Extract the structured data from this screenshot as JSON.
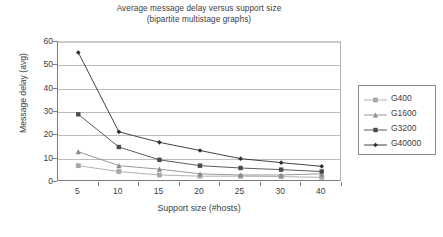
{
  "chart_data": {
    "type": "line",
    "title": "Average message delay versus support size",
    "subtitle": "(bipartite multistage graphs)",
    "xlabel": "Support size (#hosts)",
    "ylabel": "Message delay (avg)",
    "categories": [
      "5",
      "10",
      "15",
      "20",
      "25",
      "30",
      "40"
    ],
    "ylim": [
      0,
      60
    ],
    "yticks": [
      "0",
      "10",
      "20",
      "30",
      "40",
      "50",
      "60"
    ],
    "grid": "horizontal",
    "legend_position": "right",
    "series": [
      {
        "name": "G400",
        "marker": "square",
        "color": "#a8a8a8",
        "values": [
          7,
          4.5,
          3,
          2.5,
          2.5,
          2.3,
          2
        ]
      },
      {
        "name": "G1600",
        "marker": "triangle",
        "color": "#8c8c8c",
        "values": [
          13,
          7,
          5.5,
          3.5,
          3,
          3,
          3.5
        ]
      },
      {
        "name": "G3200",
        "marker": "square-dark",
        "color": "#4a4a4a",
        "values": [
          29,
          15,
          9.5,
          7,
          6,
          5.3,
          4.5
        ]
      },
      {
        "name": "G40000",
        "marker": "diamond",
        "color": "#2e2e2e",
        "values": [
          55.5,
          21.5,
          17,
          13.5,
          10,
          8.3,
          6.7
        ]
      }
    ]
  }
}
